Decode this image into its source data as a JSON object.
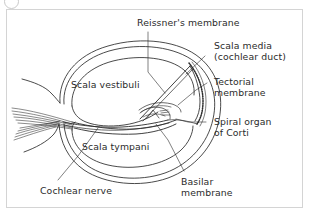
{
  "figure": {
    "corner_mark": "circle-mark",
    "frame_color": "#d4d4d4",
    "ink_color": "#2b2b2b",
    "background": "#ffffff"
  },
  "labels": {
    "reissners_membrane": "Reissner's membrane",
    "scala_media_l1": "Scala media",
    "scala_media_l2": "(cochlear duct)",
    "tectorial_l1": "Tectorial",
    "tectorial_l2": "membrane",
    "spiral_organ_l1": "Spiral organ",
    "spiral_organ_l2": "of Corti",
    "scala_vestibuli": "Scala vestibuli",
    "scala_tympani": "Scala tympani",
    "cochlear_nerve": "Cochlear nerve",
    "basilar_l1": "Basilar",
    "basilar_l2": "membrane"
  },
  "structures": [
    {
      "name": "cochlear-outer-wall",
      "kind": "outline"
    },
    {
      "name": "scala-vestibuli-chamber",
      "kind": "chamber"
    },
    {
      "name": "scala-tympani-chamber",
      "kind": "chamber"
    },
    {
      "name": "scala-media-chamber",
      "kind": "chamber"
    },
    {
      "name": "reissners-membrane-line",
      "kind": "membrane"
    },
    {
      "name": "basilar-membrane-line",
      "kind": "membrane"
    },
    {
      "name": "tectorial-membrane-flap",
      "kind": "membrane"
    },
    {
      "name": "stria-vascularis-band",
      "kind": "hatched-band"
    },
    {
      "name": "organ-of-corti-cluster",
      "kind": "cell-cluster"
    },
    {
      "name": "cochlear-nerve-bundle",
      "kind": "nerve-fibers"
    },
    {
      "name": "modiolus-edge",
      "kind": "outline"
    }
  ]
}
